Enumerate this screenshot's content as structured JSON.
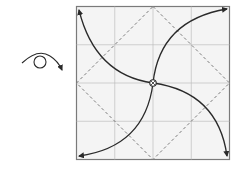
{
  "diagram": {
    "type": "origami-fold-step",
    "grid_divisions": 4,
    "symbols": {
      "turn_over": "turn-over-icon",
      "center_point": "pinch-point-icon"
    },
    "arrows": [
      {
        "from": "center",
        "to": "top-left"
      },
      {
        "from": "center",
        "to": "top-right"
      },
      {
        "from": "center",
        "to": "bottom-left"
      },
      {
        "from": "center",
        "to": "bottom-right"
      }
    ],
    "fold_lines": "valley-diamond",
    "colors": {
      "paper": "#f4f4f4",
      "border": "#7a7a7a",
      "grid": "#bdbdbd",
      "dashed": "#6e6e6e",
      "arrow": "#2a2a2a"
    }
  }
}
